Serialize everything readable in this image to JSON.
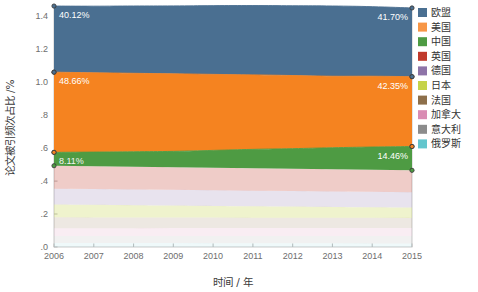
{
  "chart_data": {
    "type": "area",
    "title": "",
    "xlabel": "时间 / 年",
    "ylabel": "论文被引频次占比 /%",
    "x": [
      2006,
      2007,
      2008,
      2009,
      2010,
      2011,
      2012,
      2013,
      2014,
      2015
    ],
    "xticklabels": [
      "2006",
      "2007",
      "2008",
      "2009",
      "2010",
      "2011",
      "2012",
      "2013",
      "2014",
      "2015"
    ],
    "yticklabels": [
      ".0",
      ".2",
      ".4",
      ".6",
      ".8",
      "1.0",
      "1.2",
      "1.4"
    ],
    "yticks": [
      0.0,
      0.2,
      0.4,
      0.6,
      0.8,
      1.0,
      1.2,
      1.4
    ],
    "ylim": [
      0.0,
      1.45
    ],
    "grid": false,
    "stacked": true,
    "legend_position": "right",
    "series": [
      {
        "name": "欧盟",
        "color": "#4a6f91",
        "values": [
          0.4012,
          0.4041,
          0.4085,
          0.412,
          0.4171,
          0.4208,
          0.4233,
          0.4262,
          0.4221,
          0.417
        ]
      },
      {
        "name": "美国",
        "color": "#f58320",
        "values": [
          0.4866,
          0.4812,
          0.476,
          0.4706,
          0.4612,
          0.4518,
          0.4436,
          0.4338,
          0.4295,
          0.4235
        ]
      },
      {
        "name": "中国",
        "color": "#4e9b43",
        "values": [
          0.0811,
          0.0857,
          0.0906,
          0.096,
          0.1051,
          0.1148,
          0.1223,
          0.1309,
          0.1382,
          0.1446
        ]
      },
      {
        "name": "英国",
        "color": "#c0392b",
        "values": [
          0.139,
          0.1385,
          0.138,
          0.1375,
          0.1368,
          0.136,
          0.1352,
          0.1345,
          0.1338,
          0.133
        ]
      },
      {
        "name": "德国",
        "color": "#8e74a8",
        "values": [
          0.096,
          0.0958,
          0.0955,
          0.0952,
          0.0948,
          0.0944,
          0.094,
          0.0936,
          0.0932,
          0.0928
        ]
      },
      {
        "name": "日本",
        "color": "#c6d34a",
        "values": [
          0.078,
          0.0762,
          0.0745,
          0.0727,
          0.071,
          0.0692,
          0.0676,
          0.066,
          0.0645,
          0.063
        ]
      },
      {
        "name": "法国",
        "color": "#8d6f4a",
        "values": [
          0.066,
          0.0654,
          0.0648,
          0.0642,
          0.0636,
          0.063,
          0.0624,
          0.0618,
          0.0612,
          0.0606
        ]
      },
      {
        "name": "加拿大",
        "color": "#d98cb3",
        "values": [
          0.047,
          0.0472,
          0.0474,
          0.0476,
          0.0478,
          0.048,
          0.0482,
          0.0484,
          0.0486,
          0.0488
        ]
      },
      {
        "name": "意大利",
        "color": "#8c8c8c",
        "values": [
          0.042,
          0.0424,
          0.0428,
          0.0432,
          0.0436,
          0.044,
          0.0444,
          0.0448,
          0.0452,
          0.0456
        ]
      },
      {
        "name": "俄罗斯",
        "color": "#63c6cd",
        "values": [
          0.025,
          0.0246,
          0.0242,
          0.0238,
          0.0234,
          0.023,
          0.0226,
          0.0222,
          0.0218,
          0.0214
        ]
      }
    ],
    "annotations": [
      {
        "text": "40.12%",
        "series": "欧盟",
        "x": 2006,
        "align": "left"
      },
      {
        "text": "41.70%",
        "series": "欧盟",
        "x": 2015,
        "align": "right"
      },
      {
        "text": "48.66%",
        "series": "美国",
        "x": 2006,
        "align": "left"
      },
      {
        "text": "42.35%",
        "series": "美国",
        "x": 2015,
        "align": "right"
      },
      {
        "text": "8.11%",
        "series": "中国",
        "x": 2006,
        "align": "left"
      },
      {
        "text": "14.46%",
        "series": "中国",
        "x": 2015,
        "align": "right"
      }
    ]
  },
  "legend": {
    "items": [
      {
        "label": "欧盟",
        "color": "#4a6f91"
      },
      {
        "label": "美国",
        "color": "#f79646"
      },
      {
        "label": "中国",
        "color": "#4e9b43"
      },
      {
        "label": "英国",
        "color": "#c0392b"
      },
      {
        "label": "德国",
        "color": "#8e74a8"
      },
      {
        "label": "日本",
        "color": "#c6d34a"
      },
      {
        "label": "法国",
        "color": "#8d6f4a"
      },
      {
        "label": "加拿大",
        "color": "#d98cb3"
      },
      {
        "label": "意大利",
        "color": "#8c8c8c"
      },
      {
        "label": "俄罗斯",
        "color": "#63c6cd"
      }
    ]
  },
  "axes": {
    "x_title": "时间 / 年",
    "y_title": "论文被引频次占比 /%",
    "x_ticks": [
      "2006",
      "2007",
      "2008",
      "2009",
      "2010",
      "2011",
      "2012",
      "2013",
      "2014",
      "2015"
    ],
    "y_ticks": [
      "1.4",
      "1.2",
      "1.0",
      ".8",
      ".6",
      ".4",
      ".2",
      ".0"
    ]
  }
}
